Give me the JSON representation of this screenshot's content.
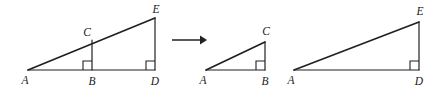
{
  "figure": {
    "background_color": "#ffffff",
    "stroke_color": "#231f20",
    "label_color": "#1a1a1a",
    "width": 438,
    "height": 95,
    "panels": [
      {
        "id": "panel-combined",
        "name": "combined-triangle",
        "description": "Large right triangle A D E with interior cevian segment C B forming smaller right triangle A B C",
        "vertices": [
          {
            "name": "A",
            "label": "A",
            "x": 28,
            "y": 70,
            "label_x": 25,
            "label_y": 84
          },
          {
            "name": "B",
            "label": "B",
            "x": 92,
            "y": 70,
            "label_x": 89,
            "label_y": 85
          },
          {
            "name": "D",
            "label": "D",
            "x": 155,
            "y": 70,
            "label_x": 152,
            "label_y": 85
          },
          {
            "name": "C",
            "label": "C",
            "x": 92,
            "y": 40,
            "label_x": 84,
            "label_y": 36
          },
          {
            "name": "E",
            "label": "E",
            "x": 155,
            "y": 18,
            "label_x": 152,
            "label_y": 13
          }
        ],
        "segments": [
          {
            "name": "hypotenuse-AE",
            "from": "A",
            "to": "E"
          },
          {
            "name": "base-AD",
            "from": "A",
            "to": "D"
          },
          {
            "name": "leg-DE",
            "from": "D",
            "to": "E"
          },
          {
            "name": "cevian-BC",
            "from": "B",
            "to": "C"
          }
        ],
        "right_angles": [
          {
            "name": "right-angle-at-B",
            "vertex_x": 92,
            "vertex_y": 70,
            "size": 9,
            "dir_x": -1,
            "dir_y": -1
          },
          {
            "name": "right-angle-at-D",
            "vertex_x": 155,
            "vertex_y": 70,
            "size": 9,
            "dir_x": -1,
            "dir_y": -1
          }
        ]
      },
      {
        "id": "panel-small",
        "name": "small-triangle-abc",
        "description": "Separated smaller right triangle A B C",
        "vertices": [
          {
            "name": "A",
            "label": "A",
            "x": 206,
            "y": 70,
            "label_x": 203,
            "label_y": 84
          },
          {
            "name": "B",
            "label": "B",
            "x": 265,
            "y": 70,
            "label_x": 262,
            "label_y": 85
          },
          {
            "name": "C",
            "label": "C",
            "x": 265,
            "y": 42,
            "label_x": 262,
            "label_y": 35
          }
        ],
        "segments": [
          {
            "name": "hypotenuse-AC",
            "from": "A",
            "to": "C"
          },
          {
            "name": "base-AB",
            "from": "A",
            "to": "B"
          },
          {
            "name": "leg-BC",
            "from": "B",
            "to": "C"
          }
        ],
        "right_angles": [
          {
            "name": "right-angle-at-B",
            "vertex_x": 265,
            "vertex_y": 70,
            "size": 9,
            "dir_x": -1,
            "dir_y": -1
          }
        ]
      },
      {
        "id": "panel-large",
        "name": "large-triangle-ade",
        "description": "Separated larger right triangle A D E",
        "vertices": [
          {
            "name": "A",
            "label": "A",
            "x": 294,
            "y": 70,
            "label_x": 291,
            "label_y": 84
          },
          {
            "name": "D",
            "label": "D",
            "x": 419,
            "y": 70,
            "label_x": 415,
            "label_y": 85
          },
          {
            "name": "E",
            "label": "E",
            "x": 419,
            "y": 22,
            "label_x": 415,
            "label_y": 15
          }
        ],
        "segments": [
          {
            "name": "hypotenuse-AE",
            "from": "A",
            "to": "E"
          },
          {
            "name": "base-AD",
            "from": "A",
            "to": "D"
          },
          {
            "name": "leg-DE",
            "from": "D",
            "to": "E"
          }
        ],
        "right_angles": [
          {
            "name": "right-angle-at-D",
            "vertex_x": 419,
            "vertex_y": 70,
            "size": 9,
            "dir_x": -1,
            "dir_y": -1
          }
        ]
      }
    ],
    "arrow": {
      "name": "transformation-arrow",
      "from_x": 172,
      "from_y": 40,
      "to_x": 206,
      "to_y": 40,
      "head_size": 6
    }
  }
}
